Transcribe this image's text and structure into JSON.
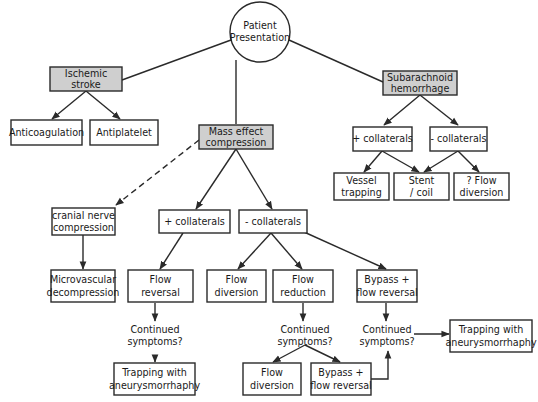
{
  "diagram": {
    "colors": {
      "shaded_fill": "#cfcfcf",
      "stroke": "#2a2a2a",
      "background": "#ffffff"
    },
    "nodes": {
      "root": {
        "line1": "Patient",
        "line2": "Presentation"
      },
      "ischemic": {
        "line1": "Ischemic",
        "line2": "stroke"
      },
      "anticoag": {
        "line1": "Anticoagulation"
      },
      "antiplatelet": {
        "line1": "Antiplatelet"
      },
      "mass": {
        "line1": "Mass effect",
        "line2": "compression"
      },
      "sah": {
        "line1": "Subarachnoid",
        "line2": "hemorrhage"
      },
      "sah_plus": {
        "line1": "+ collaterals"
      },
      "sah_minus": {
        "line1": "- collaterals"
      },
      "vessel_trap": {
        "line1": "Vessel",
        "line2": "trapping"
      },
      "stent_coil": {
        "line1": "Stent",
        "line2": "/ coil"
      },
      "q_flow_div": {
        "line1": "? Flow",
        "line2": "diversion"
      },
      "cranial": {
        "line1": "cranial nerve",
        "line2": "compression"
      },
      "mass_plus": {
        "line1": "+ collaterals"
      },
      "mass_minus": {
        "line1": "- collaterals"
      },
      "microvasc": {
        "line1": "Microvascular",
        "line2": "decompression"
      },
      "flow_rev": {
        "line1": "Flow",
        "line2": "reversal"
      },
      "flow_div_mid": {
        "line1": "Flow",
        "line2": "diversion"
      },
      "flow_red": {
        "line1": "Flow",
        "line2": "reduction"
      },
      "bypass_top": {
        "line1": "Bypass +",
        "line2": "flow reversal"
      },
      "cont_left": {
        "line1": "Continued",
        "line2": "symptoms?"
      },
      "cont_mid": {
        "line1": "Continued",
        "line2": "symptoms?"
      },
      "cont_right": {
        "line1": "Continued",
        "line2": "symptoms?"
      },
      "trap_right": {
        "line1": "Trapping with",
        "line2": "aneurysmorrhaphy"
      },
      "trap_left": {
        "line1": "Trapping with",
        "line2": "aneurysmorrhaphy"
      },
      "flow_div_bot": {
        "line1": "Flow",
        "line2": "diversion"
      },
      "bypass_bot": {
        "line1": "Bypass +",
        "line2": "flow reversal"
      }
    },
    "edges": [
      {
        "from": "root",
        "to": "ischemic",
        "style": "solid",
        "arrow": false
      },
      {
        "from": "root",
        "to": "mass",
        "style": "solid",
        "arrow": false
      },
      {
        "from": "root",
        "to": "sah",
        "style": "solid",
        "arrow": false
      },
      {
        "from": "ischemic",
        "to": "anticoag",
        "style": "solid",
        "arrow": true
      },
      {
        "from": "ischemic",
        "to": "antiplatelet",
        "style": "solid",
        "arrow": true
      },
      {
        "from": "sah",
        "to": "sah_plus",
        "style": "solid",
        "arrow": true
      },
      {
        "from": "sah",
        "to": "sah_minus",
        "style": "solid",
        "arrow": true
      },
      {
        "from": "sah_plus",
        "to": "vessel_trap",
        "style": "solid",
        "arrow": true
      },
      {
        "from": "sah_plus",
        "to": "stent_coil",
        "style": "solid",
        "arrow": true
      },
      {
        "from": "sah_minus",
        "to": "stent_coil",
        "style": "solid",
        "arrow": true
      },
      {
        "from": "sah_minus",
        "to": "q_flow_div",
        "style": "solid",
        "arrow": true
      },
      {
        "from": "mass",
        "to": "cranial",
        "style": "dashed",
        "arrow": true
      },
      {
        "from": "mass",
        "to": "mass_plus",
        "style": "solid",
        "arrow": true
      },
      {
        "from": "mass",
        "to": "mass_minus",
        "style": "solid",
        "arrow": true
      },
      {
        "from": "cranial",
        "to": "microvasc",
        "style": "solid",
        "arrow": true
      },
      {
        "from": "mass_plus",
        "to": "flow_rev",
        "style": "solid",
        "arrow": true
      },
      {
        "from": "mass_minus",
        "to": "flow_div_mid",
        "style": "solid",
        "arrow": true
      },
      {
        "from": "mass_minus",
        "to": "flow_red",
        "style": "solid",
        "arrow": true
      },
      {
        "from": "mass_minus",
        "to": "bypass_top",
        "style": "solid",
        "arrow": true
      },
      {
        "from": "flow_rev",
        "to": "cont_left",
        "style": "solid",
        "arrow": true
      },
      {
        "from": "cont_left",
        "to": "trap_left",
        "style": "solid",
        "arrow": true
      },
      {
        "from": "flow_red",
        "to": "cont_mid",
        "style": "solid",
        "arrow": true
      },
      {
        "from": "cont_mid",
        "to": "flow_div_bot",
        "style": "solid",
        "arrow": true
      },
      {
        "from": "cont_mid",
        "to": "bypass_bot",
        "style": "solid",
        "arrow": true
      },
      {
        "from": "bypass_top",
        "to": "cont_right",
        "style": "solid",
        "arrow": true
      },
      {
        "from": "bypass_bot",
        "to": "cont_right",
        "style": "solid",
        "arrow": true
      },
      {
        "from": "cont_right",
        "to": "trap_right",
        "style": "solid",
        "arrow": true
      }
    ]
  }
}
